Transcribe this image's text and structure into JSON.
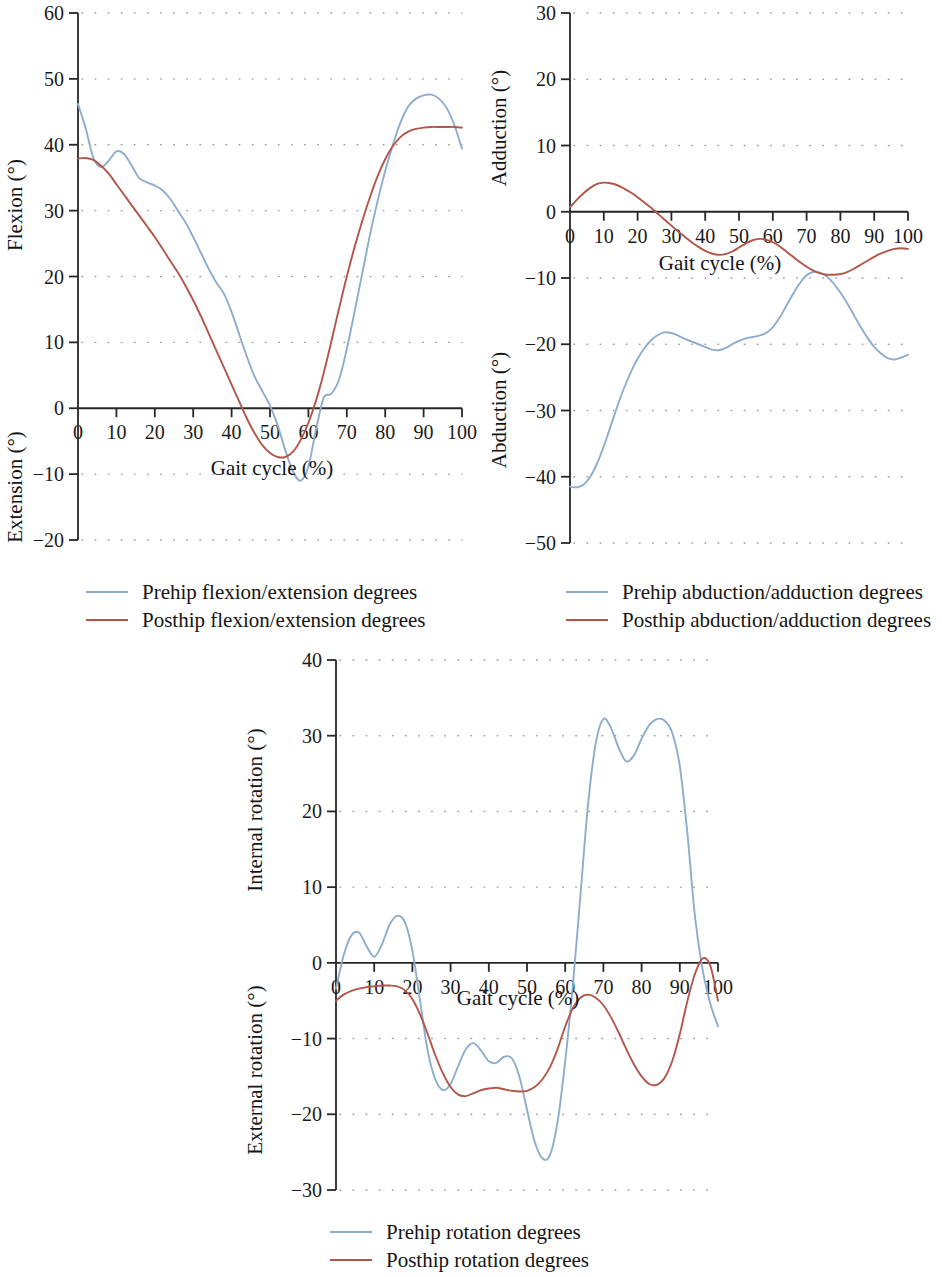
{
  "figure": {
    "background": "#ffffff",
    "series_colors": {
      "pre": "#8faccd",
      "post": "#b3564a"
    }
  },
  "chart_data": [
    {
      "id": "hip-flexion-extension",
      "type": "line",
      "title": "",
      "xlabel": "Gait cycle (%)",
      "ylabel_positive": "Flexion (°)",
      "ylabel_negative": "Extension (°)",
      "xlim": [
        0,
        100
      ],
      "ylim": [
        -20,
        60
      ],
      "xticks": [
        0,
        10,
        20,
        30,
        40,
        50,
        60,
        70,
        80,
        90,
        100
      ],
      "yticks": [
        -20,
        -10,
        0,
        10,
        20,
        30,
        40,
        50,
        60
      ],
      "grid": "dotted-horizontal",
      "legend_position": "below",
      "x": [
        0,
        2,
        4,
        6,
        8,
        10,
        12,
        14,
        16,
        18,
        20,
        22,
        24,
        26,
        28,
        30,
        32,
        34,
        36,
        38,
        40,
        42,
        44,
        46,
        48,
        50,
        52,
        54,
        56,
        58,
        60,
        62,
        64,
        66,
        68,
        70,
        72,
        74,
        76,
        78,
        80,
        82,
        84,
        86,
        88,
        90,
        92,
        94,
        96,
        98,
        100
      ],
      "series": [
        {
          "name": "Prehip flexion/extension degrees",
          "color": "#8faccd",
          "values": [
            46.2,
            42.5,
            38.0,
            36.6,
            37.6,
            39.0,
            38.6,
            36.8,
            34.9,
            34.3,
            33.8,
            33.1,
            31.8,
            30.0,
            28.2,
            26.0,
            23.6,
            21.2,
            19.1,
            17.4,
            14.6,
            11.2,
            7.8,
            4.8,
            2.6,
            0.4,
            -2.6,
            -6.4,
            -9.6,
            -11.0,
            -8.8,
            -3.2,
            1.6,
            2.2,
            4.4,
            9.0,
            14.6,
            20.4,
            26.2,
            31.4,
            36.0,
            40.0,
            43.4,
            45.8,
            47.0,
            47.5,
            47.6,
            47.0,
            45.6,
            43.0,
            39.4
          ]
        },
        {
          "name": "Posthip flexion/extension degrees",
          "color": "#b3564a",
          "values": [
            37.9,
            38.0,
            37.7,
            36.8,
            35.6,
            34.0,
            32.4,
            30.8,
            29.2,
            27.6,
            26.0,
            24.2,
            22.4,
            20.6,
            18.6,
            16.4,
            14.0,
            11.4,
            8.8,
            6.2,
            3.6,
            1.0,
            -1.6,
            -3.8,
            -5.6,
            -6.8,
            -7.4,
            -7.4,
            -6.6,
            -4.8,
            -2.2,
            1.2,
            5.4,
            10.2,
            15.2,
            20.0,
            24.4,
            28.4,
            32.0,
            35.2,
            37.8,
            39.8,
            41.2,
            42.0,
            42.4,
            42.6,
            42.7,
            42.7,
            42.7,
            42.7,
            42.6
          ]
        }
      ]
    },
    {
      "id": "hip-abduction-adduction",
      "type": "line",
      "title": "",
      "xlabel": "Gait cycle (%)",
      "ylabel_positive": "Adduction (°)",
      "ylabel_negative": "Abduction (°)",
      "xlim": [
        0,
        100
      ],
      "ylim": [
        -50,
        30
      ],
      "xticks": [
        0,
        10,
        20,
        30,
        40,
        50,
        60,
        70,
        80,
        90,
        100
      ],
      "yticks": [
        -50,
        -40,
        -30,
        -20,
        -10,
        0,
        10,
        20,
        30
      ],
      "grid": "dotted-horizontal",
      "legend_position": "below",
      "x": [
        0,
        2,
        4,
        6,
        8,
        10,
        12,
        14,
        16,
        18,
        20,
        22,
        24,
        26,
        28,
        30,
        32,
        34,
        36,
        38,
        40,
        42,
        44,
        46,
        48,
        50,
        52,
        54,
        56,
        58,
        60,
        62,
        64,
        66,
        68,
        70,
        72,
        74,
        76,
        78,
        80,
        82,
        84,
        86,
        88,
        90,
        92,
        94,
        96,
        98,
        100
      ],
      "series": [
        {
          "name": "Prehip abduction/adduction degrees",
          "color": "#8faccd",
          "values": [
            -41.5,
            -41.6,
            -41.2,
            -40.0,
            -38.0,
            -35.4,
            -32.4,
            -29.4,
            -26.6,
            -24.2,
            -22.2,
            -20.6,
            -19.4,
            -18.6,
            -18.2,
            -18.3,
            -18.7,
            -19.2,
            -19.6,
            -20.0,
            -20.4,
            -20.8,
            -20.9,
            -20.6,
            -20.0,
            -19.5,
            -19.1,
            -18.9,
            -18.7,
            -18.3,
            -17.4,
            -16.0,
            -14.2,
            -12.4,
            -10.8,
            -9.6,
            -9.1,
            -9.2,
            -9.8,
            -10.8,
            -12.2,
            -13.8,
            -15.6,
            -17.4,
            -19.0,
            -20.4,
            -21.4,
            -22.1,
            -22.3,
            -22.0,
            -21.6
          ]
        },
        {
          "name": "Posthip abduction/adduction degrees",
          "color": "#b3564a",
          "values": [
            0.7,
            1.8,
            2.8,
            3.6,
            4.2,
            4.4,
            4.3,
            4.0,
            3.5,
            2.9,
            2.2,
            1.4,
            0.6,
            -0.3,
            -1.2,
            -2.1,
            -3.0,
            -3.8,
            -4.6,
            -5.3,
            -5.9,
            -6.3,
            -6.5,
            -6.4,
            -6.0,
            -5.4,
            -4.8,
            -4.3,
            -4.1,
            -4.2,
            -4.6,
            -5.2,
            -6.0,
            -6.8,
            -7.6,
            -8.3,
            -8.9,
            -9.3,
            -9.5,
            -9.5,
            -9.4,
            -9.1,
            -8.6,
            -8.0,
            -7.4,
            -6.8,
            -6.3,
            -5.9,
            -5.6,
            -5.5,
            -5.6
          ]
        }
      ]
    },
    {
      "id": "hip-internal-external-rotation",
      "type": "line",
      "title": "",
      "xlabel": "Gait cycle (%)",
      "ylabel_positive": "Internal rotation (°)",
      "ylabel_negative": "External rotation (°)",
      "xlim": [
        0,
        100
      ],
      "ylim": [
        -30,
        40
      ],
      "xticks": [
        0,
        10,
        20,
        30,
        40,
        50,
        60,
        70,
        80,
        90,
        100
      ],
      "yticks": [
        -30,
        -20,
        -10,
        0,
        10,
        20,
        30,
        40
      ],
      "grid": "dotted-horizontal",
      "legend_position": "below",
      "x": [
        0,
        2,
        4,
        6,
        8,
        10,
        12,
        14,
        16,
        18,
        20,
        22,
        24,
        26,
        28,
        30,
        32,
        34,
        36,
        38,
        40,
        42,
        44,
        46,
        48,
        50,
        52,
        54,
        56,
        58,
        60,
        62,
        64,
        66,
        68,
        70,
        72,
        74,
        76,
        78,
        80,
        82,
        84,
        86,
        88,
        90,
        92,
        94,
        96,
        98,
        100
      ],
      "series": [
        {
          "name": "Prehip rotation degrees",
          "color": "#8faccd",
          "values": [
            -3.4,
            1.0,
            3.6,
            4.0,
            2.2,
            0.8,
            2.4,
            5.0,
            6.2,
            5.4,
            1.6,
            -5.0,
            -11.6,
            -15.4,
            -16.8,
            -16.0,
            -13.6,
            -11.4,
            -10.6,
            -11.6,
            -13.0,
            -13.2,
            -12.4,
            -12.6,
            -15.0,
            -19.4,
            -23.6,
            -25.8,
            -25.4,
            -21.0,
            -13.0,
            -3.0,
            9.0,
            21.0,
            29.0,
            32.2,
            31.0,
            28.4,
            26.6,
            27.4,
            29.6,
            31.4,
            32.2,
            32.0,
            30.4,
            26.0,
            17.0,
            6.0,
            -1.0,
            -5.4,
            -8.4
          ]
        },
        {
          "name": "Posthip rotation degrees",
          "color": "#b3564a",
          "values": [
            -5.0,
            -4.2,
            -3.7,
            -3.4,
            -3.2,
            -3.1,
            -3.0,
            -3.0,
            -3.1,
            -3.6,
            -4.8,
            -6.8,
            -9.4,
            -12.2,
            -14.6,
            -16.4,
            -17.4,
            -17.6,
            -17.2,
            -16.8,
            -16.6,
            -16.5,
            -16.7,
            -16.9,
            -17.0,
            -16.9,
            -16.4,
            -15.4,
            -13.8,
            -11.4,
            -8.4,
            -6.0,
            -4.6,
            -4.2,
            -4.6,
            -5.6,
            -7.2,
            -9.2,
            -11.4,
            -13.4,
            -15.0,
            -16.0,
            -16.1,
            -15.2,
            -13.0,
            -9.4,
            -5.0,
            -1.4,
            0.6,
            -0.4,
            -5.0
          ]
        }
      ]
    }
  ],
  "panels": {
    "flexion": {
      "ylabel_positive": "Flexion (°)",
      "ylabel_negative": "Extension (°)",
      "xlabel": "Gait cycle (%)",
      "legend": [
        {
          "label": "Prehip flexion/extension degrees",
          "color": "#8faccd"
        },
        {
          "label": "Posthip flexion/extension degrees",
          "color": "#b3564a"
        }
      ]
    },
    "abduction": {
      "ylabel_positive": "Adduction (°)",
      "ylabel_negative": "Abduction (°)",
      "xlabel": "Gait cycle (%)",
      "legend": [
        {
          "label": "Prehip abduction/adduction degrees",
          "color": "#8faccd"
        },
        {
          "label": "Posthip abduction/adduction degrees",
          "color": "#b3564a"
        }
      ]
    },
    "rotation": {
      "ylabel_positive": "Internal rotation (°)",
      "ylabel_negative": "External rotation (°)",
      "xlabel": "Gait cycle (%)",
      "legend": [
        {
          "label": "Prehip rotation degrees",
          "color": "#8faccd"
        },
        {
          "label": "Posthip rotation degrees",
          "color": "#b3564a"
        }
      ]
    }
  }
}
